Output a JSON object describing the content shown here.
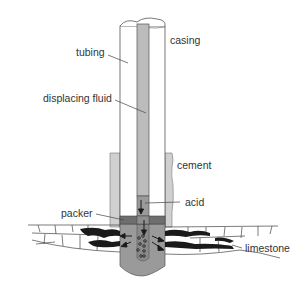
{
  "diagram": {
    "type": "well acidizing cross-section",
    "labels": {
      "casing": "casing",
      "tubing": "tubing",
      "displacing_fluid": "displacing fluid",
      "cement": "cement",
      "acid": "acid",
      "packer": "packer",
      "limestone": "limestone"
    },
    "colors": {
      "casing_fill": "#ffffff",
      "tubing_fluid": "#bcbcbc",
      "cement": "#d0d0d0",
      "acid": "#9a9a9a",
      "packer": "#6e6e6e",
      "outline": "#555555",
      "fracture": "#1a1a1a"
    }
  }
}
